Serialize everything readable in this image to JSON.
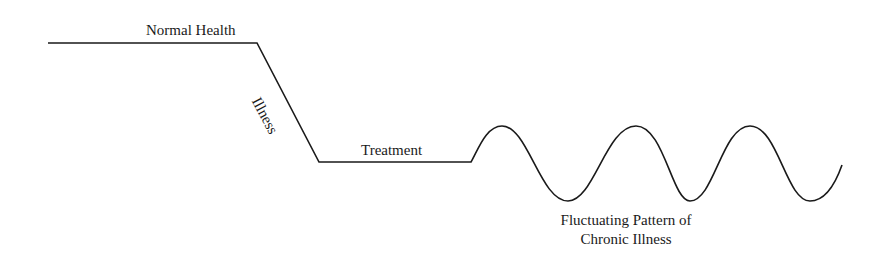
{
  "diagram": {
    "labels": {
      "normal_health": "Normal Health",
      "illness": "Illness",
      "treatment": "Treatment",
      "chronic_line1": "Fluctuating Pattern of",
      "chronic_line2": "Chronic Illness"
    },
    "stroke_color": "#1a1a1a",
    "background": "#ffffff",
    "stages": [
      {
        "name": "Normal Health",
        "shape": "flat-high"
      },
      {
        "name": "Illness",
        "shape": "decline"
      },
      {
        "name": "Treatment",
        "shape": "flat-low"
      },
      {
        "name": "Fluctuating Pattern of Chronic Illness",
        "shape": "wave"
      }
    ]
  }
}
